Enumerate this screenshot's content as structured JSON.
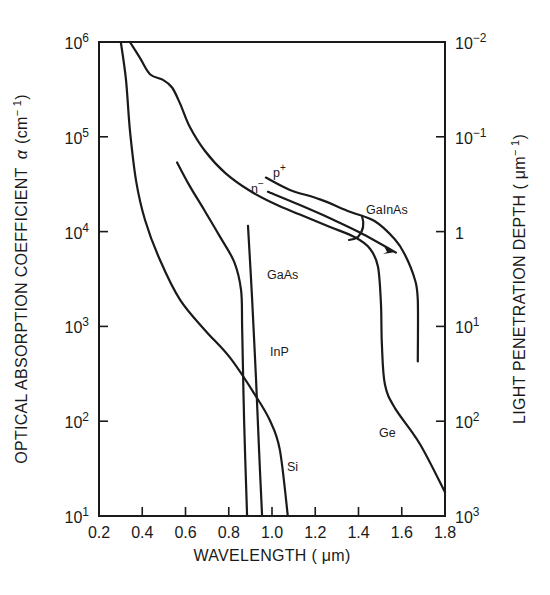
{
  "chart_data": {
    "type": "line",
    "title": "",
    "xlabel": "WAVELENGTH (μm)",
    "ylabel": "OPTICAL ABSORPTION COEFFICIENT α (cm⁻¹)",
    "y2label": "LIGHT PENETRATION DEPTH (μm⁻¹)",
    "xlim": [
      0.2,
      1.8
    ],
    "ylim_log10": [
      1,
      6
    ],
    "yscale": "log",
    "grid": false,
    "legend": "inline labels",
    "x_ticks": [
      "0.2",
      "0.4",
      "0.6",
      "0.8",
      "1.0",
      "1.2",
      "1.4",
      "1.6",
      "1.8"
    ],
    "x_tick_values": [
      0.2,
      0.4,
      0.6,
      0.8,
      1.0,
      1.2,
      1.4,
      1.6,
      1.8
    ],
    "y_ticks": [
      {
        "base": "10",
        "exp": "6",
        "log": 6
      },
      {
        "base": "10",
        "exp": "5",
        "log": 5
      },
      {
        "base": "10",
        "exp": "4",
        "log": 4
      },
      {
        "base": "10",
        "exp": "3",
        "log": 3
      },
      {
        "base": "10",
        "exp": "2",
        "log": 2
      },
      {
        "base": "10",
        "exp": "1",
        "log": 1
      }
    ],
    "y2_ticks": [
      {
        "base": "10",
        "exp": "−2",
        "log": 6
      },
      {
        "base": "10",
        "exp": "−1",
        "log": 5
      },
      {
        "base": "1",
        "exp": "",
        "log": 4
      },
      {
        "base": "10",
        "exp": "1",
        "log": 3
      },
      {
        "base": "10",
        "exp": "2",
        "log": 2
      },
      {
        "base": "10",
        "exp": "3",
        "log": 1
      }
    ],
    "series": [
      {
        "name": "Ge",
        "x": [
          0.343,
          0.39,
          0.436,
          0.496,
          0.538,
          0.575,
          0.621,
          0.69,
          0.783,
          0.898,
          1.014,
          1.129,
          1.268,
          1.384,
          1.453,
          1.49,
          1.504,
          1.508,
          1.522,
          1.568,
          1.684,
          1.8
        ],
        "log_alpha": [
          6.0,
          5.83,
          5.66,
          5.6,
          5.52,
          5.35,
          5.1,
          4.85,
          4.62,
          4.43,
          4.29,
          4.18,
          4.05,
          3.94,
          3.82,
          3.63,
          3.23,
          2.81,
          2.39,
          2.14,
          1.76,
          1.25
        ]
      },
      {
        "name": "Si",
        "x": [
          0.301,
          0.325,
          0.343,
          0.371,
          0.413,
          0.482,
          0.575,
          0.69,
          0.806,
          0.921,
          0.99,
          1.036,
          1.073
        ],
        "log_alpha": [
          6.0,
          5.6,
          5.07,
          4.54,
          4.12,
          3.7,
          3.28,
          2.96,
          2.67,
          2.28,
          2.01,
          1.7,
          1.0
        ]
      },
      {
        "name": "GaAs",
        "x": [
          0.561,
          0.617,
          0.686,
          0.756,
          0.825,
          0.857,
          0.862,
          0.871,
          0.885
        ],
        "log_alpha": [
          4.73,
          4.49,
          4.23,
          3.96,
          3.68,
          3.38,
          2.96,
          2.01,
          1.0
        ]
      },
      {
        "name": "InP",
        "x": [
          0.889,
          0.908,
          0.926,
          0.94,
          0.954
        ],
        "log_alpha": [
          4.06,
          3.29,
          2.45,
          1.71,
          1.0
        ]
      },
      {
        "name": "GaInAs p⁺",
        "x": [
          0.972,
          1.083,
          1.222,
          1.36,
          1.476,
          1.568,
          1.614,
          1.66,
          1.674,
          1.674
        ],
        "log_alpha": [
          4.57,
          4.44,
          4.34,
          4.21,
          4.11,
          3.92,
          3.76,
          3.5,
          3.28,
          2.63
        ]
      },
      {
        "name": "GaInAs n⁻",
        "x": [
          0.981,
          1.129,
          1.268,
          1.406,
          1.573
        ],
        "log_alpha": [
          4.42,
          4.28,
          4.14,
          3.99,
          3.78
        ]
      }
    ],
    "annotations": [
      "GaInAs",
      "n⁻",
      "p⁺",
      "GaAs",
      "InP",
      "Si",
      "Ge"
    ]
  },
  "labels": {
    "xlabel": "WAVELENGTH ( μm)",
    "ylabel_main": "OPTICAL ABSORPTION COEFFICIENT",
    "ylabel_alpha": "α",
    "ylabel_unit": "(cm",
    "ylabel_unit_exp": "− 1",
    "ylabel_unit_close": ")",
    "y2label_main": "LIGHT PENETRATION DEPTH",
    "y2label_unit": "( μm",
    "y2label_unit_exp": "− 1",
    "y2label_unit_close": ")",
    "ge": "Ge",
    "si": "Si",
    "gaas": "GaAs",
    "inp": "InP",
    "gainas": "GaInAs",
    "n_minus": "n",
    "n_minus_sup": "−",
    "p_plus": "p",
    "p_plus_sup": "+"
  }
}
